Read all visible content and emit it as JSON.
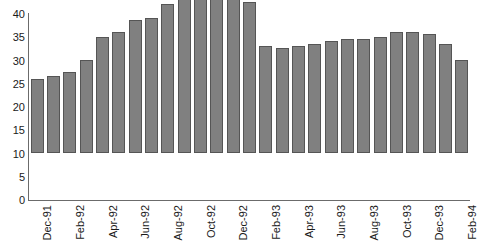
{
  "chart_data": {
    "type": "bar",
    "title": "",
    "subtitle": "",
    "xlabel": "",
    "ylabel": "",
    "ylim": [
      0,
      40
    ],
    "y_ticks": [
      0,
      5,
      10,
      15,
      20,
      25,
      30,
      35,
      40
    ],
    "grid": false,
    "legend": "none",
    "bar_color": "#808080",
    "bar_border_color": "#555555",
    "axis_color": "#6b6b6b",
    "x_tick_interval_months": 2,
    "x_tick_labels": [
      "Dec-91",
      "Feb-92",
      "Apr-92",
      "Jun-92",
      "Aug-92",
      "Oct-92",
      "Dec-92",
      "Feb-93",
      "Apr-93",
      "Jun-93",
      "Aug-93",
      "Oct-93",
      "Dec-93",
      "Feb-94"
    ],
    "categories": [
      "Dec-91",
      "Jan-92",
      "Feb-92",
      "Mar-92",
      "Apr-92",
      "May-92",
      "Jun-92",
      "Jul-92",
      "Aug-92",
      "Sep-92",
      "Oct-92",
      "Nov-92",
      "Dec-92",
      "Jan-93",
      "Feb-93",
      "Mar-93",
      "Apr-93",
      "May-93",
      "Jun-93",
      "Jul-93",
      "Aug-93",
      "Sep-93",
      "Oct-93",
      "Nov-93",
      "Dec-93",
      "Jan-94",
      "Feb-94"
    ],
    "values": [
      16,
      16.5,
      17.5,
      20,
      25,
      26,
      28.5,
      29,
      32,
      35,
      37,
      35,
      34,
      32.5,
      23,
      22.5,
      23,
      23.5,
      24,
      24.5,
      24.5,
      25,
      26,
      26,
      25.5,
      23.5,
      20
    ]
  }
}
